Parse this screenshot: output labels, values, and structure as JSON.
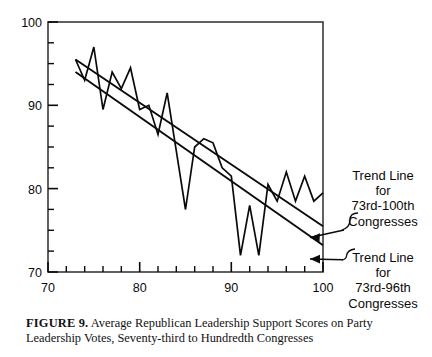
{
  "figure": {
    "caption_label": "FIGURE 9.",
    "caption_text": "Average Republican Leadership Support Scores on Party Leadership Votes, Seventy-third to Hundredth Congresses"
  },
  "annotations": {
    "top": {
      "line1": "Trend Line",
      "line2": "for",
      "line3": "73rd-100th",
      "line4": "Congresses"
    },
    "bottom": {
      "line1": "Trend Line",
      "line2": "for",
      "line3": "73rd-96th",
      "line4": "Congresses"
    }
  },
  "colors": {
    "ink": "#0a0a0a",
    "frame": "#3a3a3a",
    "background": "#ffffff"
  },
  "chart_data": {
    "type": "line",
    "title": "Average Republican Leadership Support Scores on Party Leadership Votes, Seventy-third to Hundredth Congresses",
    "xlabel": "",
    "ylabel": "",
    "xlim": [
      70,
      100
    ],
    "ylim": [
      70,
      100
    ],
    "grid": false,
    "legend_position": "right-outside",
    "x_ticks_major": [
      70,
      80,
      90,
      100
    ],
    "x_ticks_minor_step": 2,
    "y_ticks_major": [
      70,
      80,
      90,
      100
    ],
    "y_ticks_minor_step": 2.5,
    "x": [
      73,
      74,
      75,
      76,
      77,
      78,
      79,
      80,
      81,
      82,
      83,
      84,
      85,
      86,
      87,
      88,
      89,
      90,
      91,
      92,
      93,
      94,
      95,
      96,
      97,
      98,
      99,
      100
    ],
    "series": [
      {
        "name": "Average Republican Leadership Support Score",
        "values": [
          95.5,
          93.0,
          97.0,
          89.5,
          94.0,
          92.0,
          94.5,
          89.5,
          90.0,
          86.5,
          91.5,
          84.5,
          77.5,
          85.0,
          86.0,
          85.5,
          82.5,
          81.5,
          72.0,
          78.0,
          72.0,
          80.5,
          78.5,
          82.0,
          78.5,
          81.5,
          78.5,
          79.5
        ]
      },
      {
        "name": "Trend Line for 73rd-100th Congresses",
        "type": "trend",
        "x_endpoints": [
          73,
          100
        ],
        "y_endpoints": [
          95.5,
          75.5
        ]
      },
      {
        "name": "Trend Line for 73rd-96th Congresses",
        "type": "trend",
        "x_endpoints": [
          73,
          100
        ],
        "y_endpoints": [
          94.0,
          73.2
        ]
      }
    ]
  }
}
